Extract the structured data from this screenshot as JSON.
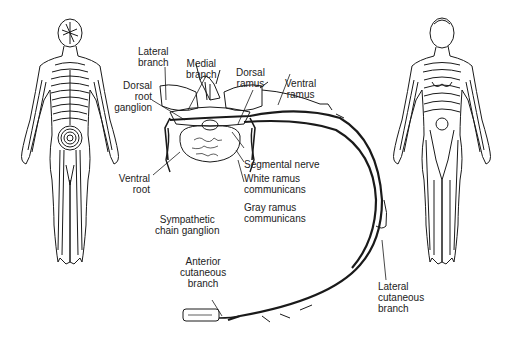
{
  "figure": {
    "type": "anatomical-diagram",
    "left_figure": "posterior body view with dermatome bands",
    "right_figure": "anterior body view with dermatome bands",
    "colors": {
      "ink": "#1a1a1a",
      "label": "#222222",
      "background": "#ffffff"
    }
  },
  "labels": {
    "lateral_branch": "Lateral\nbranch",
    "medial_branch": "Medial\nbranch",
    "dorsal_ramus": "Dorsal\nramus",
    "ventral_ramus": "Ventral\nramus",
    "dorsal_root_ganglion": "Dorsal\nroot\nganglion",
    "segmental_nerve": "Segmental nerve",
    "white_ramus": "White ramus\ncommunicans",
    "gray_ramus": "Gray ramus\ncommunicans",
    "ventral_root": "Ventral\nroot",
    "sympathetic_chain": "Sympathetic\nchain ganglion",
    "anterior_cutaneous": "Anterior\ncutaneous\nbranch",
    "lateral_cutaneous": "Lateral\ncutaneous\nbranch"
  }
}
